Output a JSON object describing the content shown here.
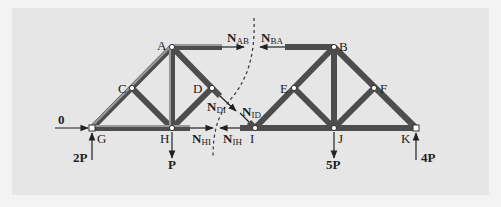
{
  "diagram": {
    "type": "truss_method_of_sections",
    "nodes": [
      {
        "id": "A",
        "label": "A",
        "x": 172,
        "y": 47
      },
      {
        "id": "B",
        "label": "B",
        "x": 334,
        "y": 47
      },
      {
        "id": "C",
        "label": "C",
        "x": 132,
        "y": 88
      },
      {
        "id": "D",
        "label": "D",
        "x": 212,
        "y": 88
      },
      {
        "id": "E",
        "label": "E",
        "x": 294,
        "y": 88
      },
      {
        "id": "F",
        "label": "F",
        "x": 374,
        "y": 88
      },
      {
        "id": "G",
        "label": "G",
        "x": 92,
        "y": 128
      },
      {
        "id": "H",
        "label": "H",
        "x": 172,
        "y": 128
      },
      {
        "id": "I",
        "label": "I",
        "x": 255,
        "y": 128
      },
      {
        "id": "J",
        "label": "J",
        "x": 334,
        "y": 128
      },
      {
        "id": "K",
        "label": "K",
        "x": 416,
        "y": 128
      }
    ],
    "members": [
      [
        "G",
        "C"
      ],
      [
        "C",
        "A"
      ],
      [
        "A",
        "H"
      ],
      [
        "C",
        "H"
      ],
      [
        "A",
        "D"
      ],
      [
        "D",
        "H"
      ],
      [
        "G",
        "H"
      ],
      [
        "I",
        "E"
      ],
      [
        "E",
        "B"
      ],
      [
        "B",
        "J"
      ],
      [
        "E",
        "J"
      ],
      [
        "B",
        "F"
      ],
      [
        "F",
        "K"
      ],
      [
        "F",
        "J"
      ],
      [
        "I",
        "J"
      ],
      [
        "J",
        "K"
      ]
    ],
    "cut_forces": {
      "N_AB": {
        "main": "N",
        "sub": "AB"
      },
      "N_BA": {
        "main": "N",
        "sub": "BA"
      },
      "N_DI": {
        "main": "N",
        "sub": "DI"
      },
      "N_ID": {
        "main": "N",
        "sub": "ID"
      },
      "N_HI": {
        "main": "N",
        "sub": "HI"
      },
      "N_IH": {
        "main": "N",
        "sub": "IH"
      }
    },
    "loads": {
      "horizontal_G": "0",
      "reaction_G": "2P",
      "load_H": "P",
      "load_J": "5P",
      "reaction_K": "4P"
    },
    "colors": {
      "panel": "#e6e6e6",
      "member": "#555555",
      "member_highlight": "#9a9a9a",
      "text": "#222222",
      "cut_line": "#333333"
    }
  }
}
